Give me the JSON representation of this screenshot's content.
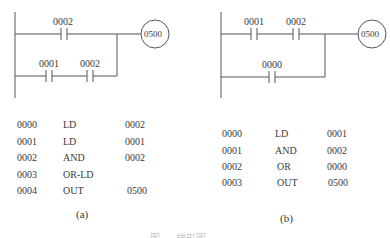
{
  "diagram_a": {
    "rung1": {
      "contacts": [
        "0002"
      ]
    },
    "rung2": {
      "contacts": [
        "0001",
        "0002"
      ]
    },
    "coil": "0500",
    "label": "(a)",
    "program": [
      {
        "step": "0000",
        "instr": "LD",
        "operand": "0002"
      },
      {
        "step": "0001",
        "instr": "LD",
        "operand": "0001"
      },
      {
        "step": "0002",
        "instr": "AND",
        "operand": "0002"
      },
      {
        "step": "0003",
        "instr": "OR-LD",
        "operand": ""
      },
      {
        "step": "0004",
        "instr": "OUT",
        "operand": "0500"
      }
    ]
  },
  "diagram_b": {
    "rung1": {
      "contacts": [
        "0001",
        "0002"
      ]
    },
    "rung2": {
      "contacts": [
        "0000"
      ]
    },
    "coil": "0500",
    "label": "(b)",
    "program": [
      {
        "step": "0000",
        "instr": "LD",
        "operand": "0001"
      },
      {
        "step": "0001",
        "instr": "AND",
        "operand": "0002"
      },
      {
        "step": "0002",
        "instr": "OR",
        "operand": "0000"
      },
      {
        "step": "0003",
        "instr": "OUT",
        "operand": "0500"
      }
    ]
  },
  "caption": "图 . .   梯形图 . ."
}
